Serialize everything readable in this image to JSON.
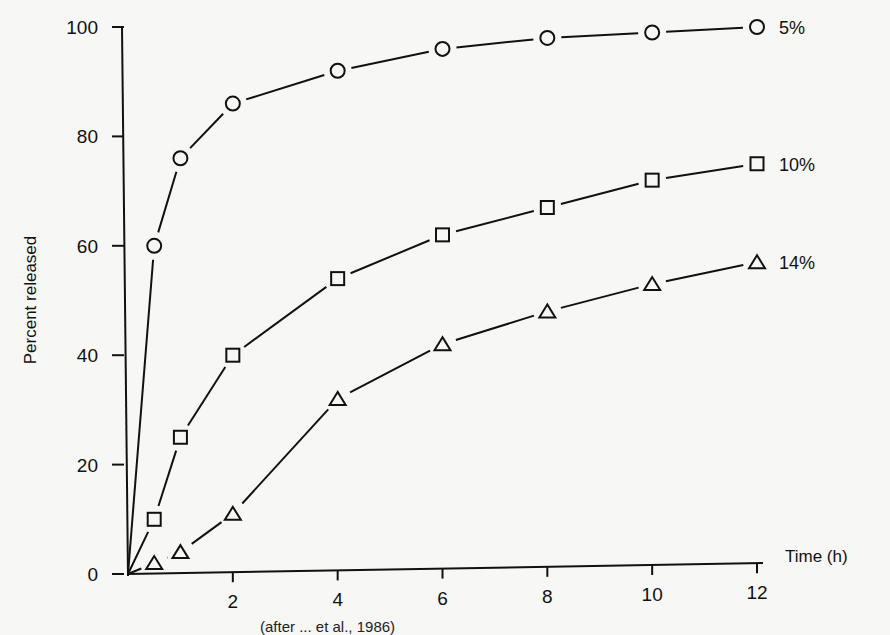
{
  "chart_data": {
    "type": "line",
    "title": "",
    "xlabel": "Time (h)",
    "ylabel": "Percent released",
    "xlim": [
      0,
      12
    ],
    "ylim": [
      0,
      100
    ],
    "x_ticks": [
      2,
      4,
      6,
      8,
      10,
      12
    ],
    "y_ticks": [
      0,
      20,
      40,
      60,
      80,
      100
    ],
    "grid": false,
    "legend": "inline labels at right end of each curve",
    "x": [
      0.5,
      1,
      2,
      4,
      6,
      8,
      10,
      12
    ],
    "series": [
      {
        "name": "5%",
        "marker": "circle",
        "values": [
          60,
          76,
          86,
          92,
          96,
          98,
          99,
          100
        ]
      },
      {
        "name": "10%",
        "marker": "square",
        "values": [
          10,
          25,
          40,
          54,
          62,
          67,
          72,
          75
        ]
      },
      {
        "name": "14%",
        "marker": "triangle",
        "values": [
          2,
          4,
          11,
          32,
          42,
          48,
          53,
          57
        ]
      }
    ],
    "annotations": [
      "5%",
      "10%",
      "14%"
    ]
  },
  "caption": "(after ... et al., 1986)"
}
